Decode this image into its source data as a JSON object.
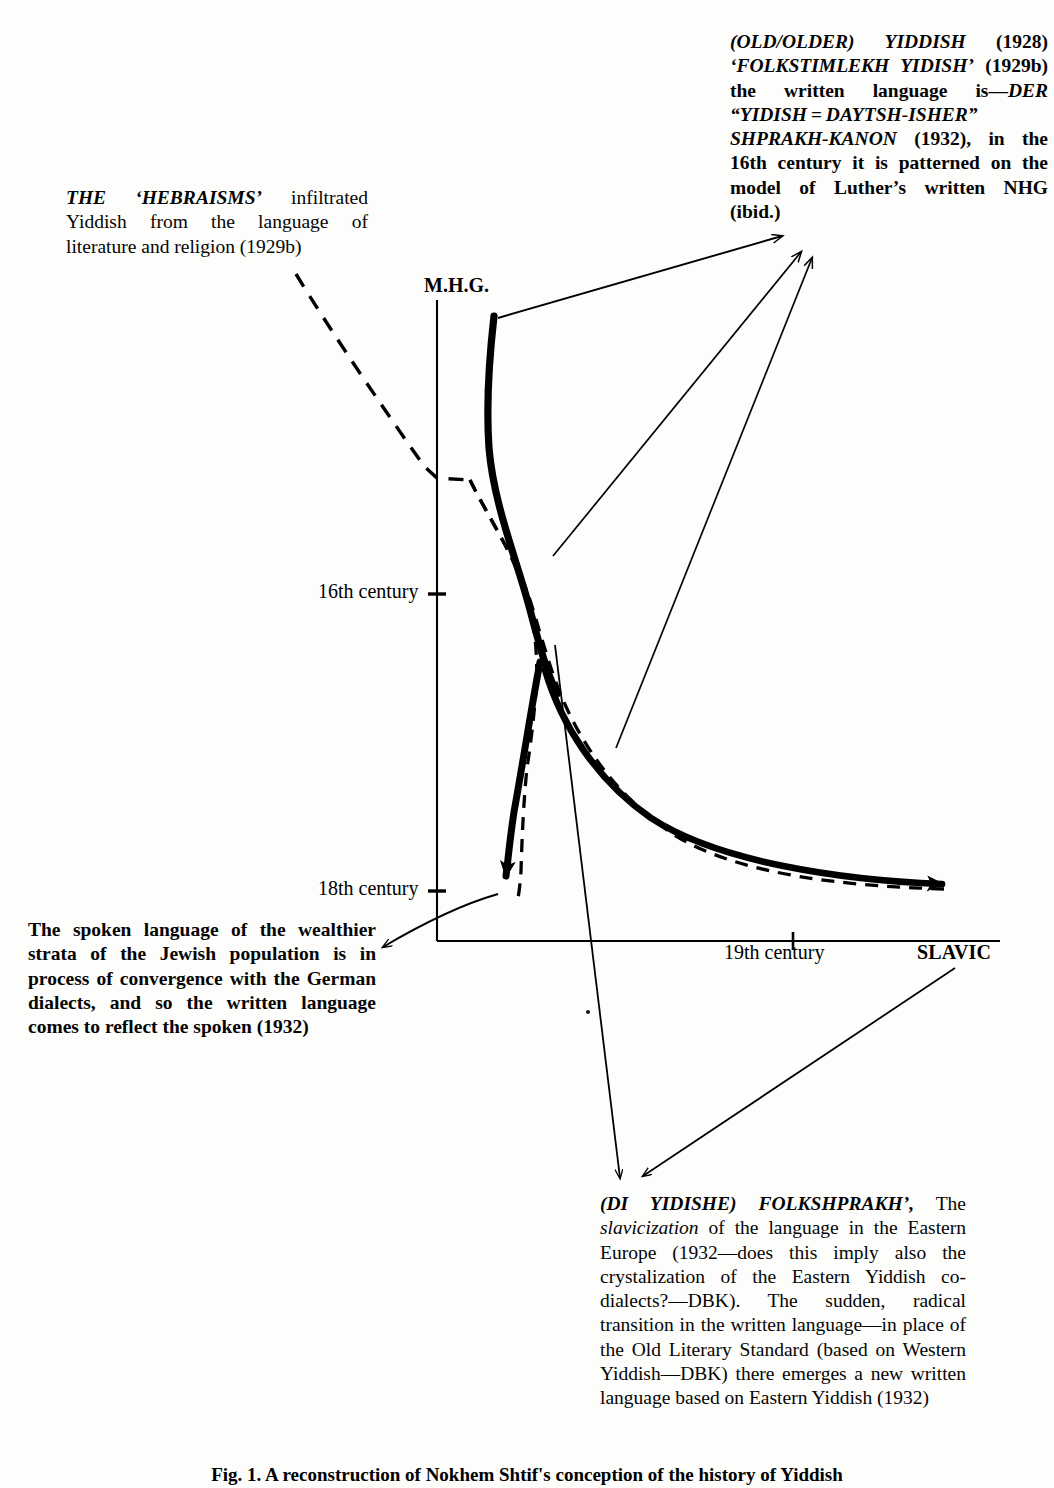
{
  "figure": {
    "caption": "Fig. 1. A reconstruction of Nokhem Shtif's conception of the history of Yiddish",
    "axes": {
      "y_axis_label": "M.H.G.",
      "x_axis_label": "SLAVIC",
      "y_ticks": [
        "16th century",
        "18th century"
      ],
      "x_ticks": [
        "19th century"
      ]
    }
  },
  "notes": {
    "top_right": {
      "name": "old-older-yiddish-note",
      "lines": [
        "(OLD/OLDER) YIDDISH (1928)",
        "'FOLKSTIMLEKH YIDISH'",
        "(1929b) the written language is—",
        "DER  “YIDISH = DAYTSH-",
        "ISHER” SHPRAKH-KANON",
        "(1932), in the 16th century it is",
        "patterned on the model of Luther's",
        "written NHG (ibid.)"
      ],
      "segments": [
        {
          "text": "(OLD/OLDER) YIDDISH",
          "style": "bold-italic"
        },
        {
          "text": " (1928) ",
          "style": "bold"
        },
        {
          "text": "‘FOLKSTIMLEKH   YIDISH’",
          "style": "bold-italic"
        },
        {
          "text": " (1929b) the written language is—",
          "style": "bold"
        },
        {
          "text": "DER   “YIDISH = DAYTSH-ISHER” SHPRAKH-KANON",
          "style": "bold-italic"
        },
        {
          "text": " (1932), in the 16th century it is patterned on the model of Luther’s written NHG (ibid.)",
          "style": "bold"
        }
      ]
    },
    "top_left": {
      "name": "hebraisms-note",
      "segments": [
        {
          "text": "THE ‘HEBRAISMS’",
          "style": "bold-italic"
        },
        {
          "text": " infiltrated Yiddish from the language of literature and religion (1929b)",
          "style": "regular"
        }
      ]
    },
    "bottom_left": {
      "name": "spoken-language-note",
      "segments": [
        {
          "text": "The spoken language of the wealthier strata of the Jewish population is in process of convergence with the German dialects, and so the written language comes to reflect the spoken (1932)",
          "style": "bold"
        }
      ]
    },
    "bottom_right": {
      "name": "folkshprakh-note",
      "segments": [
        {
          "text": "(DI YIDISHE) FOLKSHPRAKH’,",
          "style": "bold-italic"
        },
        {
          "text": " The ",
          "style": "regular"
        },
        {
          "text": "slavicization",
          "style": "italic"
        },
        {
          "text": " of the language in the Eastern Europe (1932—does this imply also the crystalization of the Eastern Yiddish co-dialects?—DBK). The sudden, radical transition in the written language—in place of the Old Literary Standard (based on Western Yiddish—DBK) there emerges a new written language based on Eastern Yiddish (1932)",
          "style": "regular"
        }
      ]
    }
  },
  "chart_data": {
    "type": "line",
    "title": "A reconstruction of Nokhem Shtif's conception of the history of Yiddish",
    "xlabel": "SLAVIC",
    "ylabel": "M.H.G.",
    "xticklabels": [
      "19th century"
    ],
    "yticklabels": [
      "16th century",
      "18th century"
    ],
    "grid": false,
    "legend": null,
    "series": [
      {
        "name": "spoken-language-curve",
        "style": "solid-bold",
        "arrowheads": [
          "down-left-at-18th-century",
          "right-at-slavic-axis"
        ],
        "description": "Heavy solid S-curve descending from M.H.G. origin, splitting near the 17th century into a branch arrowed down toward the 18th-century tick and a branch sweeping right toward SLAVIC."
      },
      {
        "name": "written-language-curve",
        "style": "dashed",
        "description": "Dashed curve shadowing the solid curve from the 16th-century level down and rightwards to SLAVIC."
      },
      {
        "name": "hebraisms-dashed-leader",
        "style": "dashed-leader",
        "description": "Dashed leader from the 'HEBRAISMS' note down-right to the 16th-century level of the main curve."
      }
    ],
    "annotation_leaders": [
      {
        "from": "old-older-yiddish-note",
        "to": "curve-origin-at-MHG"
      },
      {
        "from": "old-older-yiddish-note",
        "to": "curve-mid-16th-17th-century"
      },
      {
        "from": "old-older-yiddish-note",
        "to": "curve-right-branch"
      },
      {
        "from": "spoken-language-note",
        "to": "18th-century-tick"
      },
      {
        "from": "folkshprakh-note",
        "to": "curve-upper-left-region"
      },
      {
        "from": "folkshprakh-note",
        "to": "slavic-arrow-tip"
      }
    ]
  }
}
